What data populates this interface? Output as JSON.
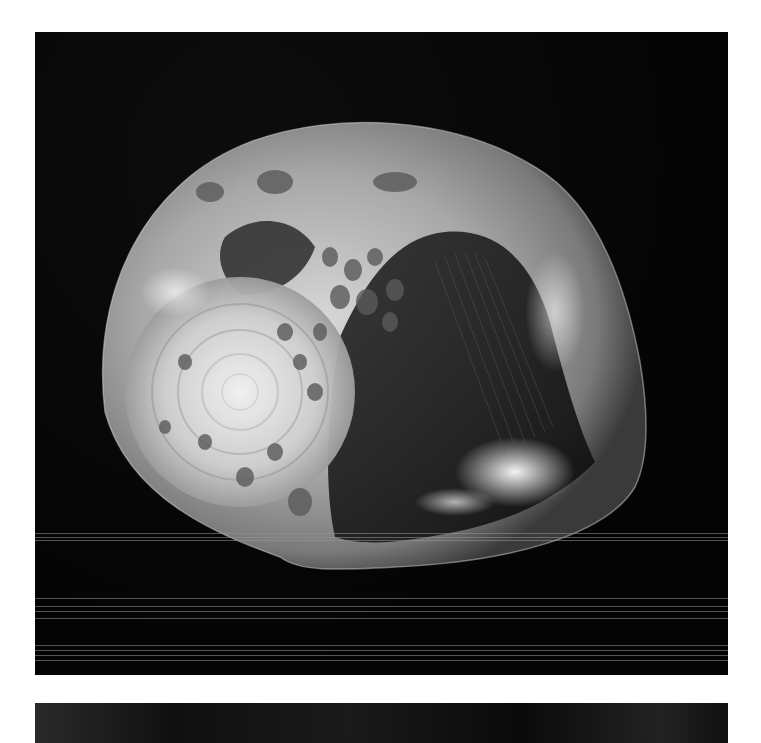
{
  "image": {
    "subject": "shell photograph",
    "style": "black-and-white",
    "background_color": "#ffffff",
    "photo_background": "#050505",
    "shell_highlight": "#e8e8e8",
    "shell_midtone": "#8a8a8a",
    "shell_shadow": "#1c1c1c"
  },
  "photos": [
    {
      "name": "main-shell-photo",
      "frame": {
        "x": 35,
        "y": 32,
        "w": 693,
        "h": 643
      }
    },
    {
      "name": "next-photo-partial",
      "frame": {
        "x": 35,
        "y": 703,
        "w": 693,
        "h": 11
      }
    }
  ],
  "scanlines_y": [
    533,
    537,
    540,
    598,
    606,
    611,
    618,
    645,
    650,
    655,
    660
  ]
}
